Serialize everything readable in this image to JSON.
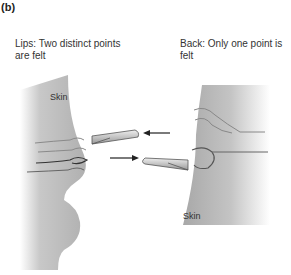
{
  "figure": {
    "panel_label": "(b)",
    "lips": {
      "caption": "Lips: Two distinct points are felt",
      "skin_label": "Skin"
    },
    "back": {
      "caption": "Back: Only one point is felt",
      "skin_label": "Skin"
    }
  }
}
